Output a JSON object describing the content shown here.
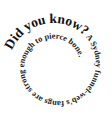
{
  "graphic": {
    "headline": "Did you know?",
    "fact": " A Sydney funnel-web's fangs are strong enough to pierce bone.",
    "full_text": "Did you know? A Sydney funnel-web's fangs are strong enough to pierce bone.",
    "layout": "spiral-clockwise-inward",
    "text_color": "#111111",
    "background_color": "#ffffff"
  }
}
